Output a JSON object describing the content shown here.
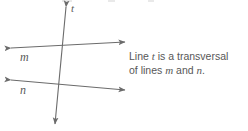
{
  "figure": {
    "type": "geometry-diagram",
    "background_color": "#ffffff",
    "stroke_color": "#6b6b6b",
    "label_color": "#5a5a5a",
    "caption_color": "#575757",
    "lines": [
      {
        "name": "t",
        "role": "transversal",
        "label": "t",
        "label_x": 71,
        "label_y": 3,
        "x1": 66,
        "y1": 6,
        "x2": 55,
        "y2": 125,
        "arrow_start": true,
        "arrow_end": true
      },
      {
        "name": "m",
        "role": "parallel-line",
        "label": "m",
        "label_x": 20,
        "label_y": 51,
        "x1": 11,
        "y1": 48,
        "x2": 125,
        "y2": 42,
        "arrow_start": true,
        "arrow_end": true
      },
      {
        "name": "n",
        "role": "parallel-line",
        "label": "n",
        "label_x": 20,
        "label_y": 84,
        "x1": 11,
        "y1": 80,
        "x2": 125,
        "y2": 90,
        "arrow_start": true,
        "arrow_end": true
      }
    ],
    "intersections": [
      {
        "lines": "t,m",
        "x": 62,
        "y": 45
      },
      {
        "lines": "t,n",
        "x": 59,
        "y": 85
      }
    ]
  },
  "caption": {
    "full_text": "Line t is a transversal of lines m and n.",
    "line1_pre": "Line ",
    "line1_var": "t",
    "line1_post": " is a transversal",
    "line2_pre": "of lines ",
    "line2_var1": "m",
    "line2_mid": " and ",
    "line2_var2": "n",
    "line2_post": "."
  }
}
